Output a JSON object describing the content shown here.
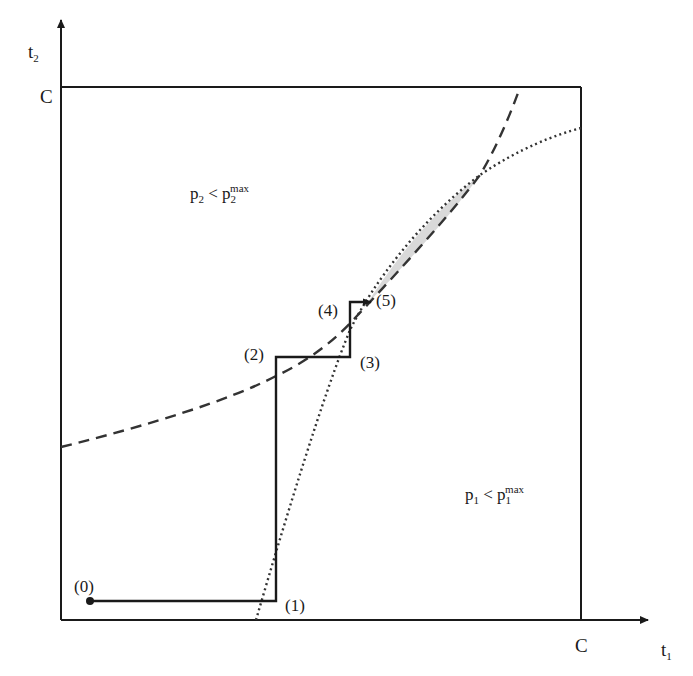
{
  "diagram": {
    "axes": {
      "y_label_base": "t",
      "y_label_sub": "2",
      "x_label_base": "t",
      "x_label_sub": "1",
      "y_tick": "C",
      "x_tick": "C"
    },
    "regions": {
      "upper_left": {
        "base": "p",
        "sub": "2",
        "op": " < ",
        "base2": "p",
        "sub2": "2",
        "sup2": "max"
      },
      "lower_right": {
        "base": "p",
        "sub": "1",
        "op": " < ",
        "base2": "p",
        "sub2": "1",
        "sup2": "max"
      }
    },
    "points": [
      {
        "label": "(0)"
      },
      {
        "label": "(1)"
      },
      {
        "label": "(2)"
      },
      {
        "label": "(3)"
      },
      {
        "label": "(4)"
      },
      {
        "label": "(5)"
      }
    ],
    "colors": {
      "stroke": "#1a1a1a",
      "dashed_curve": "#333333",
      "dotted_curve": "#333333",
      "shaded_region": "#d9d9d9"
    }
  }
}
